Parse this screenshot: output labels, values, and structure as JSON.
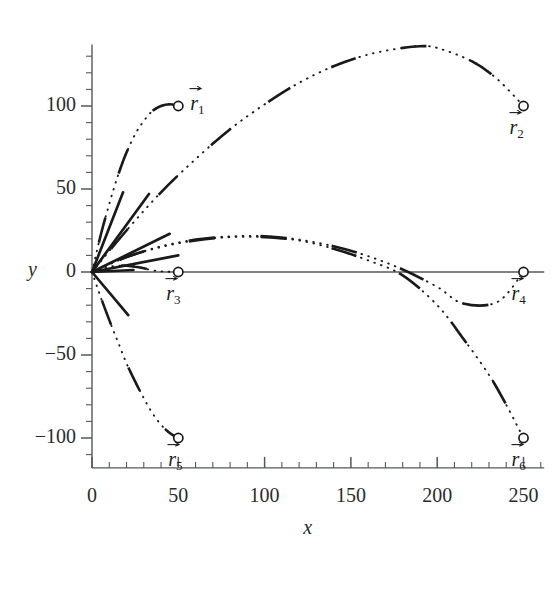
{
  "figure": {
    "kind": "projectile-trajectory-plot",
    "background": "#ffffff",
    "ink": "#1a1a1a"
  },
  "axes": {
    "x_name": "x",
    "y_name": "y",
    "x_ticks": [
      "0",
      "50",
      "100",
      "150",
      "200",
      "250"
    ],
    "y_ticks": [
      "100",
      "50",
      "0",
      "−50",
      "−100"
    ]
  },
  "markers": [
    {
      "id": "r1",
      "label": "r",
      "sub": "1",
      "x": 50,
      "y": 100
    },
    {
      "id": "r2",
      "label": "r",
      "sub": "2",
      "x": 250,
      "y": 100
    },
    {
      "id": "r3",
      "label": "r",
      "sub": "3",
      "x": 50,
      "y": 0
    },
    {
      "id": "r4",
      "label": "r",
      "sub": "4",
      "x": 250,
      "y": 0
    },
    {
      "id": "r5",
      "label": "r",
      "sub": "5",
      "x": 50,
      "y": -100
    },
    {
      "id": "r6",
      "label": "r",
      "sub": "6",
      "x": 250,
      "y": -100
    }
  ],
  "chart_data": {
    "type": "line",
    "title": "",
    "xlabel": "x",
    "ylabel": "y",
    "xlim": [
      0,
      262
    ],
    "ylim": [
      -118,
      137
    ],
    "xticks": [
      0,
      50,
      100,
      150,
      200,
      250
    ],
    "yticks": [
      100,
      50,
      0,
      -50,
      -100
    ],
    "x_minor_step": 10,
    "y_minor_step": 10,
    "grid": false,
    "legend": null,
    "origin": [
      0,
      0
    ],
    "annotations": [
      {
        "text": "r1",
        "x": 50,
        "y": 100
      },
      {
        "text": "r2",
        "x": 250,
        "y": 100
      },
      {
        "text": "r3",
        "x": 50,
        "y": 0
      },
      {
        "text": "r4",
        "x": 250,
        "y": 0
      },
      {
        "text": "r5",
        "x": 50,
        "y": -100
      },
      {
        "text": "r6",
        "x": 250,
        "y": -100
      }
    ],
    "series": [
      {
        "name": "trajectory-to-r1",
        "style": "dotted",
        "endpoint": [
          50,
          100
        ],
        "points": [
          [
            0,
            0
          ],
          [
            5,
            22
          ],
          [
            10,
            41
          ],
          [
            15,
            58
          ],
          [
            20,
            72
          ],
          [
            25,
            83
          ],
          [
            30,
            91
          ],
          [
            35,
            97
          ],
          [
            40,
            100
          ],
          [
            45,
            101
          ],
          [
            50,
            100
          ]
        ]
      },
      {
        "name": "trajectory-to-r2",
        "style": "dotted",
        "endpoint": [
          250,
          100
        ],
        "points": [
          [
            0,
            0
          ],
          [
            20,
            25
          ],
          [
            40,
            48
          ],
          [
            60,
            68
          ],
          [
            80,
            86
          ],
          [
            100,
            101
          ],
          [
            120,
            114
          ],
          [
            140,
            124
          ],
          [
            160,
            131
          ],
          [
            180,
            135
          ],
          [
            190,
            136
          ],
          [
            200,
            135
          ],
          [
            220,
            127
          ],
          [
            235,
            116
          ],
          [
            250,
            100
          ]
        ]
      },
      {
        "name": "trajectory-to-r3",
        "style": "dotted",
        "endpoint": [
          50,
          0
        ],
        "points": [
          [
            0,
            0
          ],
          [
            5,
            2.0
          ],
          [
            10,
            3.2
          ],
          [
            15,
            3.8
          ],
          [
            20,
            3.8
          ],
          [
            25,
            3.2
          ],
          [
            30,
            2.2
          ],
          [
            35,
            1.0
          ],
          [
            40,
            0.4
          ],
          [
            45,
            0.1
          ],
          [
            50,
            0
          ]
        ]
      },
      {
        "name": "trajectory-to-r4",
        "style": "dotted",
        "endpoint": [
          250,
          0
        ],
        "points": [
          [
            0,
            0
          ],
          [
            20,
            9
          ],
          [
            40,
            15.5
          ],
          [
            60,
            19.5
          ],
          [
            80,
            21.5
          ],
          [
            100,
            21.5
          ],
          [
            120,
            19.5
          ],
          [
            140,
            15.5
          ],
          [
            160,
            9.5
          ],
          [
            180,
            1.5
          ],
          [
            200,
            -9
          ],
          [
            215,
            -19
          ],
          [
            235,
            -18
          ],
          [
            250,
            0
          ]
        ]
      },
      {
        "name": "trajectory-to-r5",
        "style": "dotted",
        "endpoint": [
          50,
          -100
        ],
        "points": [
          [
            0,
            0
          ],
          [
            5,
            -15
          ],
          [
            10,
            -29
          ],
          [
            15,
            -42
          ],
          [
            20,
            -55
          ],
          [
            25,
            -66
          ],
          [
            30,
            -76
          ],
          [
            35,
            -85
          ],
          [
            40,
            -92
          ],
          [
            45,
            -97
          ],
          [
            50,
            -100
          ]
        ]
      },
      {
        "name": "trajectory-to-r6",
        "style": "dotted",
        "endpoint": [
          250,
          -100
        ],
        "points": [
          [
            0,
            0
          ],
          [
            20,
            9
          ],
          [
            40,
            15
          ],
          [
            60,
            19
          ],
          [
            80,
            21
          ],
          [
            100,
            21
          ],
          [
            120,
            19
          ],
          [
            140,
            14
          ],
          [
            160,
            7
          ],
          [
            180,
            -2
          ],
          [
            200,
            -20
          ],
          [
            215,
            -40
          ],
          [
            230,
            -62
          ],
          [
            240,
            -80
          ],
          [
            250,
            -100
          ]
        ]
      }
    ],
    "velocity_vectors": [
      {
        "name": "v1",
        "angle_deg": 77,
        "from": [
          0,
          0
        ],
        "to": [
          18,
          48
        ]
      },
      {
        "name": "v2",
        "angle_deg": 53,
        "from": [
          0,
          0
        ],
        "to": [
          33,
          47
        ]
      },
      {
        "name": "v3",
        "angle_deg": 33,
        "from": [
          0,
          0
        ],
        "to": [
          45,
          23
        ]
      },
      {
        "name": "v4",
        "angle_deg": 16,
        "from": [
          0,
          0
        ],
        "to": [
          50,
          10
        ]
      },
      {
        "name": "v5",
        "angle_deg": 3,
        "from": [
          0,
          0
        ],
        "to": [
          24,
          1.2
        ]
      },
      {
        "name": "v6",
        "angle_deg": -35,
        "from": [
          0,
          0
        ],
        "to": [
          21,
          -26
        ]
      }
    ]
  }
}
